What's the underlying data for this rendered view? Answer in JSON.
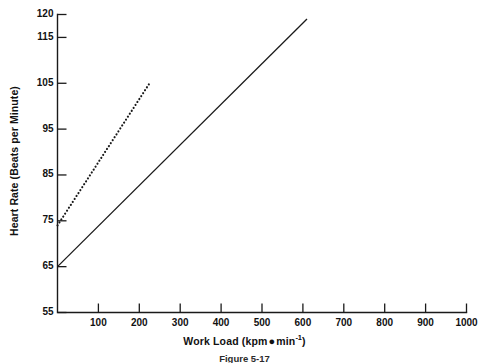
{
  "figure": {
    "caption": "Figure 5-17",
    "background_color": "#ffffff",
    "ink_color": "#1a1a1a"
  },
  "chart_data": {
    "type": "line",
    "title": "",
    "subtitle": "",
    "xlabel_text": "Work Load (kpm",
    "xlabel_middot": "●",
    "xlabel_unit": "min",
    "xlabel_exponent": "-1",
    "xlabel_close": ")",
    "xlabel": "Work Load (kpm ● min-1)",
    "ylabel": "Heart Rate (Beats per Minute)",
    "xlim": [
      0,
      1000
    ],
    "ylim": [
      55,
      120
    ],
    "grid": false,
    "legend": "none",
    "x_ticks": [
      100,
      200,
      300,
      400,
      500,
      600,
      700,
      800,
      900,
      1000
    ],
    "x_tick_labels": [
      "100",
      "200",
      "300",
      "400",
      "500",
      "600",
      "700",
      "800",
      "900",
      "1000"
    ],
    "y_ticks": [
      55,
      65,
      75,
      85,
      95,
      105,
      115,
      120
    ],
    "y_tick_labels": [
      "55",
      "65",
      "75",
      "85",
      "95",
      "105",
      "115",
      "120"
    ],
    "series": [
      {
        "name": "dotted-line",
        "style": "dotted",
        "color": "#1a1a1a",
        "x": [
          0,
          225
        ],
        "values": [
          74,
          105
        ]
      },
      {
        "name": "solid-line",
        "style": "solid",
        "color": "#1a1a1a",
        "x": [
          0,
          610
        ],
        "values": [
          65,
          119
        ]
      }
    ]
  }
}
